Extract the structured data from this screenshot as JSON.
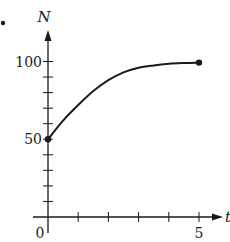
{
  "bullet": "•",
  "chart_data": {
    "type": "line",
    "title": "",
    "xlabel": "t",
    "ylabel": "N",
    "xlim": [
      0,
      5.8
    ],
    "ylim": [
      0,
      112
    ],
    "x_ticks": [
      0,
      1,
      2,
      3,
      4,
      5
    ],
    "x_tick_labels": [
      "0",
      "",
      "",
      "",
      "",
      "5"
    ],
    "y_ticks": [
      0,
      10,
      20,
      30,
      40,
      50,
      60,
      70,
      80,
      90,
      100
    ],
    "y_tick_labels": [
      "",
      "",
      "",
      "",
      "",
      "50",
      "",
      "",
      "",
      "",
      "100"
    ],
    "origin_label": "0",
    "grid": false,
    "legend": null,
    "series": [
      {
        "name": "N(t)",
        "x": [
          0,
          0.5,
          1,
          1.5,
          2,
          2.5,
          3,
          3.5,
          4,
          4.5,
          5
        ],
        "values": [
          50,
          62,
          72,
          81,
          88,
          93,
          96,
          97.5,
          98.5,
          99,
          99.3
        ],
        "endpoints_marked": true,
        "start_point": [
          0,
          50
        ],
        "end_point": [
          5,
          99.3
        ]
      }
    ],
    "annotations": [
      "N approaches 100 asymptotically"
    ]
  },
  "colors": {
    "ink": "#1a1a1a",
    "background": "#ffffff"
  }
}
